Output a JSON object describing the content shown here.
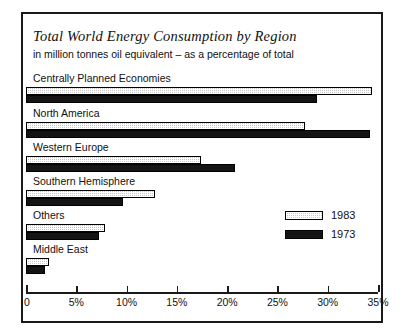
{
  "chart_data": {
    "type": "bar",
    "orientation": "horizontal",
    "title": "Total World Energy Consumption by Region",
    "subtitle": "in million tonnes oil equivalent  –  as a percentage of total",
    "xlabel": "",
    "ylabel": "",
    "xlim": [
      0,
      35
    ],
    "grid": false,
    "legend_position": "bottom-right",
    "tick_labels": [
      "0",
      "5%",
      "10%",
      "15%",
      "20%",
      "25%",
      "30%",
      "35%"
    ],
    "tick_values": [
      0,
      5,
      10,
      15,
      20,
      25,
      30,
      35
    ],
    "categories": [
      "Centrally Planned Economies",
      "North America",
      "Western Europe",
      "Southern Hemisphere",
      "Others",
      "Middle East"
    ],
    "series": [
      {
        "name": "1983",
        "style": "light-stipple",
        "color": "#cfcfcf",
        "values": [
          34.4,
          27.7,
          17.4,
          12.8,
          7.9,
          2.3
        ]
      },
      {
        "name": "1973",
        "style": "solid-black",
        "color": "#141414",
        "values": [
          28.9,
          34.2,
          20.8,
          9.6,
          7.3,
          1.9
        ]
      }
    ]
  },
  "legend": {
    "items": [
      {
        "label": "1983"
      },
      {
        "label": "1973"
      }
    ]
  }
}
